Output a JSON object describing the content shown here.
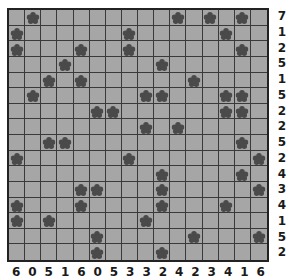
{
  "puzzle": {
    "type": "tents-and-trees",
    "rows": 16,
    "cols": 16,
    "colors": {
      "cell_bg": "#a6a6a6",
      "grid_line": "#3a3a3a",
      "tree": "#4a4a4a",
      "border": "#222222",
      "clue_text": "#1a1a1a"
    },
    "row_clues": [
      "7",
      "1",
      "2",
      "5",
      "1",
      "5",
      "2",
      "2",
      "5",
      "2",
      "4",
      "3",
      "4",
      "1",
      "5",
      "2"
    ],
    "col_clues": [
      "6",
      "0",
      "5",
      "1",
      "6",
      "0",
      "5",
      "3",
      "3",
      "2",
      "4",
      "2",
      "3",
      "4",
      "1",
      "6"
    ],
    "trees": [
      [
        1,
        10,
        12,
        14
      ],
      [
        0,
        7,
        13
      ],
      [
        0,
        4,
        7,
        14
      ],
      [
        3,
        9
      ],
      [
        2,
        4,
        11
      ],
      [
        1,
        8,
        9,
        13,
        14
      ],
      [
        5,
        6,
        13,
        14
      ],
      [
        8,
        10
      ],
      [
        2,
        3,
        14
      ],
      [
        0,
        7,
        15
      ],
      [
        9,
        14
      ],
      [
        4,
        5,
        9,
        15
      ],
      [
        0,
        4,
        9,
        13
      ],
      [
        0,
        2,
        8
      ],
      [
        5,
        11,
        15
      ],
      [
        5,
        9
      ]
    ]
  }
}
